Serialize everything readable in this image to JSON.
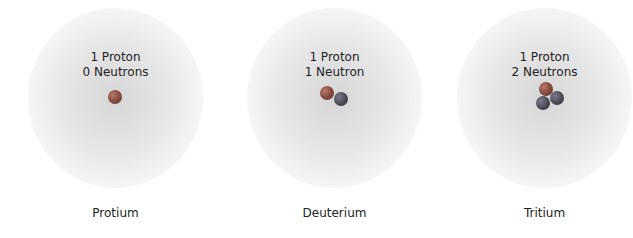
{
  "atoms": [
    {
      "proton_label": "1 Proton",
      "neutron_label": "0 Neutrons",
      "name": "Protium"
    },
    {
      "proton_label": "1 Proton",
      "neutron_label": "1 Neutron",
      "name": "Deuterium"
    },
    {
      "proton_label": "1 Proton",
      "neutron_label": "2 Neutrons",
      "name": "Tritium"
    }
  ]
}
